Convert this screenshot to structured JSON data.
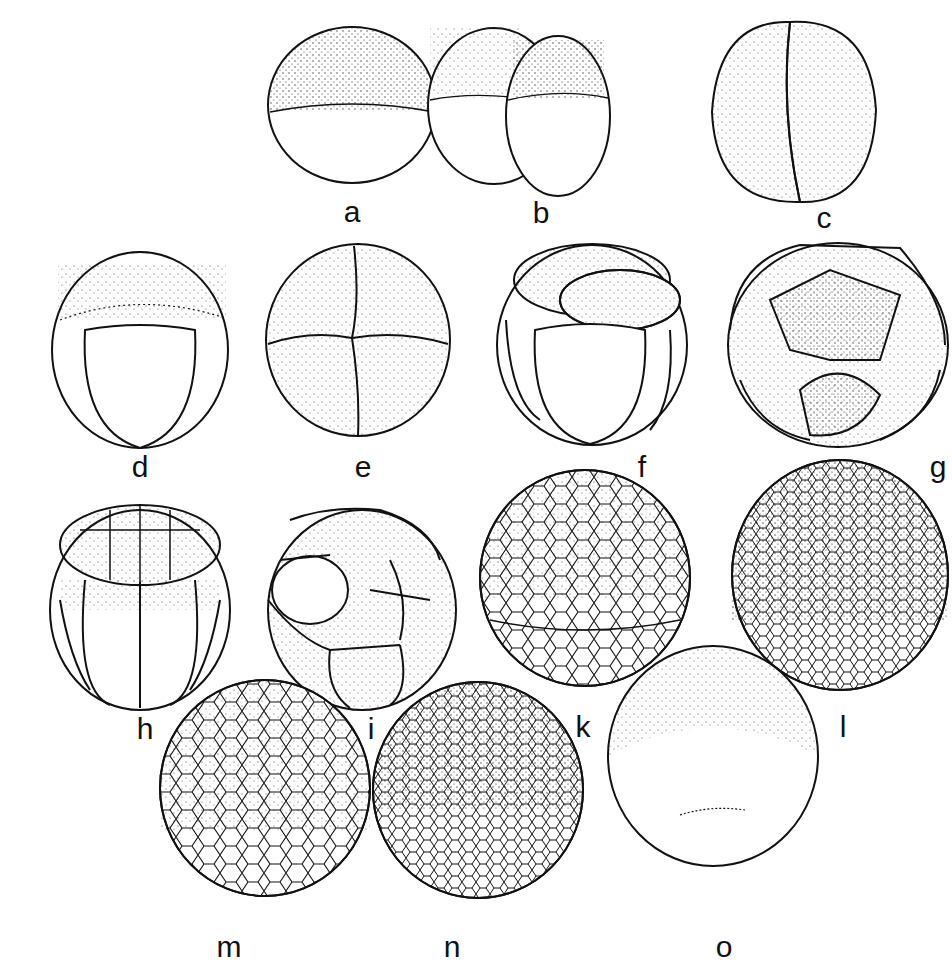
{
  "figure": {
    "stages": [
      {
        "id": "a",
        "label": "a",
        "cx": 352,
        "cy": 105,
        "rx": 84,
        "ry": 78,
        "cells": 1
      },
      {
        "id": "b",
        "label": "b",
        "cx": 528,
        "cy": 110,
        "rx": 80,
        "ry": 84,
        "cells": 2
      },
      {
        "id": "c",
        "label": "c",
        "cx": 792,
        "cy": 112,
        "rx": 84,
        "ry": 92,
        "cells": 2
      },
      {
        "id": "d",
        "label": "d",
        "cx": 140,
        "cy": 350,
        "rx": 88,
        "ry": 98,
        "cells": 4
      },
      {
        "id": "e",
        "label": "e",
        "cx": 358,
        "cy": 340,
        "rx": 92,
        "ry": 96,
        "cells": 4
      },
      {
        "id": "f",
        "label": "f",
        "cx": 592,
        "cy": 345,
        "rx": 95,
        "ry": 100,
        "cells": 8
      },
      {
        "id": "g",
        "label": "g",
        "cx": 838,
        "cy": 345,
        "rx": 110,
        "ry": 102,
        "cells": 8
      },
      {
        "id": "h",
        "label": "h",
        "cx": 140,
        "cy": 610,
        "rx": 90,
        "ry": 100,
        "cells": 16
      },
      {
        "id": "i",
        "label": "i",
        "cx": 362,
        "cy": 610,
        "rx": 94,
        "ry": 100,
        "cells": 16
      },
      {
        "id": "k",
        "label": "k",
        "cx": 585,
        "cy": 578,
        "rx": 105,
        "ry": 108,
        "cells": 64
      },
      {
        "id": "l",
        "label": "l",
        "cx": 840,
        "cy": 575,
        "rx": 108,
        "ry": 115,
        "cells": 128
      },
      {
        "id": "m",
        "label": "m",
        "cx": 265,
        "cy": 788,
        "rx": 105,
        "ry": 108,
        "cells": 256
      },
      {
        "id": "n",
        "label": "n",
        "cx": 478,
        "cy": 790,
        "rx": 105,
        "ry": 108,
        "cells": 512
      },
      {
        "id": "o",
        "label": "o",
        "cx": 713,
        "cy": 756,
        "rx": 105,
        "ry": 110,
        "cells": 0
      }
    ]
  },
  "labels": {
    "a": {
      "text": "a",
      "x": 352,
      "y": 197
    },
    "b": {
      "text": "b",
      "x": 541,
      "y": 200
    },
    "c": {
      "text": "c",
      "x": 824,
      "y": 205
    },
    "d": {
      "text": "d",
      "x": 140,
      "y": 455
    },
    "e": {
      "text": "e",
      "x": 363,
      "y": 455
    },
    "f": {
      "text": "f",
      "x": 642,
      "y": 455
    },
    "g": {
      "text": "g",
      "x": 938,
      "y": 456
    },
    "h": {
      "text": "h",
      "x": 145,
      "y": 718
    },
    "i": {
      "text": "i",
      "x": 371,
      "y": 718
    },
    "k": {
      "text": "k",
      "x": 583,
      "y": 715
    },
    "l": {
      "text": "l",
      "x": 843,
      "y": 715
    },
    "m": {
      "text": "m",
      "x": 229,
      "y": 936
    },
    "n": {
      "text": "n",
      "x": 452,
      "y": 936
    },
    "o": {
      "text": "o",
      "x": 724,
      "y": 936
    }
  },
  "colors": {
    "ink": "#111111",
    "paper": "#ffffff",
    "stipple": "#333333"
  }
}
